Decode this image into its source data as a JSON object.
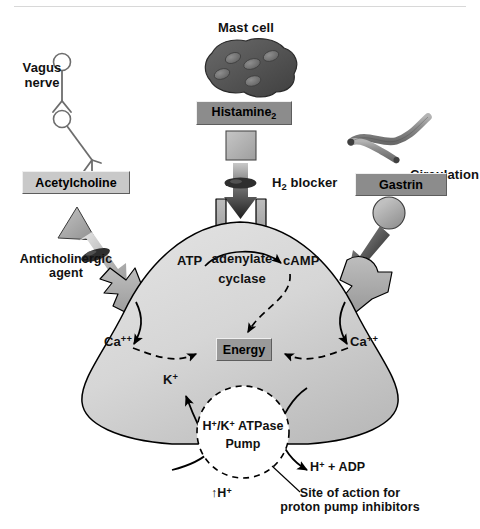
{
  "figure": {
    "background_color": "#ffffff",
    "ink_color": "#000000"
  },
  "divider": {
    "name": "top-rule",
    "color": "#d8d8d8"
  },
  "labels": {
    "vagus_nerve": "Vagus\nnerve",
    "vagus_line1": "Vagus",
    "vagus_line2": "nerve",
    "mast_cell": "Mast cell",
    "circulation": "Circulation",
    "anticholinergic_line1": "Anticholinergic",
    "anticholinergic_line2": "agent",
    "h2_blocker_html": "H2 blocker",
    "h2_blocker_main": "H",
    "h2_blocker_sub": "2",
    "h2_blocker_rest": " blocker",
    "atp": "ATP",
    "adenylate": "adenylate",
    "cyclase": "cyclase",
    "camp": "cAMP",
    "calcium_left": "Ca",
    "calcium_left_sup": "++",
    "calcium_right": "Ca",
    "calcium_right_sup": "++",
    "potassium": "K",
    "potassium_sup": "+",
    "pump_line1_a": "H",
    "pump_line1_sup1": "+",
    "pump_line1_b": "/K",
    "pump_line1_sup2": "+",
    "pump_line1_c": " ATPase",
    "pump_line2": "Pump",
    "h_plus_adp_a": "H",
    "h_plus_adp_sup": "+",
    "h_plus_adp_b": " + ADP",
    "increased_h_arrow": "↑H",
    "increased_h_sup": "+",
    "site_line1": "Site of action for",
    "site_line2": "proton pump inhibitors"
  },
  "boxes": {
    "acetylcholine": {
      "label": "Acetylcholine",
      "fill": "#c9c9c9",
      "text_color": "#000000"
    },
    "histamine": {
      "label_main": "Histamine",
      "label_sub": "2",
      "fill": "#8c8c8c",
      "text_color": "#000000"
    },
    "gastrin": {
      "label": "Gastrin",
      "fill": "#8c8c8c",
      "text_color": "#000000"
    },
    "energy": {
      "label": "Energy",
      "fill": "#9a9a9a",
      "text_color": "#000000"
    }
  },
  "shapes": {
    "parietal_cell": {
      "name": "parietal-cell-body",
      "fill_light": "#dcdcdc",
      "fill_dark": "#bdbdbd",
      "stroke": "#000000"
    },
    "mast_cell": {
      "name": "mast-cell-blob",
      "fill": "#555555",
      "granule_fill": "#7d7d7d",
      "stroke": "#2b2b2b"
    },
    "blood_vessel": {
      "name": "blood-vessel",
      "fill": "#909090",
      "stroke": "#3d3d3d"
    },
    "receptor_left": {
      "name": "acetylcholine-receptor",
      "fill": "#a8a8a8",
      "stroke": "#000000"
    },
    "receptor_center": {
      "name": "histamine2-receptor",
      "fill": "#a8a8a8",
      "stroke": "#000000"
    },
    "receptor_right": {
      "name": "gastrin-receptor",
      "fill": "#a8a8a8",
      "stroke": "#000000"
    },
    "ach_molecule": {
      "name": "acetylcholine-triangle",
      "fill": "#a8a8a8",
      "stroke": "#3a3a3a"
    },
    "gastrin_molecule": {
      "name": "gastrin-circle",
      "fill": "#a8a8a8",
      "stroke": "#3a3a3a"
    },
    "h2_molecule": {
      "name": "histamine-square",
      "fill": "#b4b4b4",
      "stroke": "#4a4a4a"
    },
    "pump": {
      "name": "proton-pump-circle",
      "fill": "#ffffff",
      "stroke": "#000000",
      "stroke_dash": "5 4"
    },
    "blocker_disc_left": {
      "name": "anticholinergic-blocker-disc",
      "fill": "#3a3a3a"
    },
    "blocker_disc_center": {
      "name": "h2-blocker-disc",
      "fill": "#3a3a3a"
    }
  },
  "pathways": [
    {
      "name": "vagus-acetylcholine-pathway",
      "source": "Vagus nerve",
      "mediator": "Acetylcholine",
      "inhibitor": "Anticholinergic agent",
      "second_messenger": "Ca++"
    },
    {
      "name": "mast-cell-histamine-pathway",
      "source": "Mast cell",
      "mediator": "Histamine2",
      "inhibitor": "H2 blocker",
      "second_messenger": "cAMP"
    },
    {
      "name": "circulation-gastrin-pathway",
      "source": "Circulation",
      "mediator": "Gastrin",
      "inhibitor": "",
      "second_messenger": "Ca++"
    }
  ],
  "outputs": {
    "pump_name": "H+/K+ ATPase Pump",
    "products": [
      "H+ + ADP",
      "K+",
      "↑H+"
    ],
    "inhibitor_site": "Site of action for proton pump inhibitors"
  }
}
